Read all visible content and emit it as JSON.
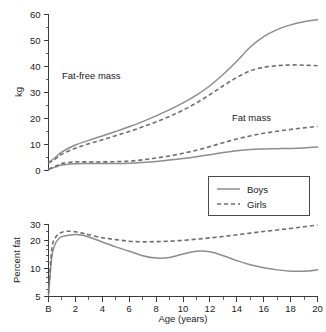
{
  "figure": {
    "background": "#ffffff",
    "line_color_boys": "#8d8d8d",
    "line_color_girls": "#6f6f6f",
    "axis_color": "#3a3a3a"
  },
  "legend": {
    "position": "center-middle",
    "items": [
      {
        "label": "Boys",
        "style": "solid"
      },
      {
        "label": "Girls",
        "style": "dashed"
      }
    ]
  },
  "xaxis": {
    "label": "Age (years)",
    "ticks": [
      "B",
      "2",
      "4",
      "6",
      "8",
      "10",
      "12",
      "14",
      "16",
      "18",
      "20"
    ],
    "values": [
      0,
      2,
      4,
      6,
      8,
      10,
      12,
      14,
      16,
      18,
      20
    ],
    "minor_step": 1,
    "range": [
      0,
      20
    ]
  },
  "chart_data": [
    {
      "type": "line",
      "id": "body-composition-kg",
      "title": "",
      "xlabel": "Age (years)",
      "ylabel": "kg",
      "xlim": [
        0,
        20
      ],
      "ylim": [
        0,
        60
      ],
      "ytick_labels": [
        "0",
        "10",
        "20",
        "30",
        "40",
        "50",
        "60"
      ],
      "ytick_values": [
        0,
        10,
        20,
        30,
        40,
        50,
        60
      ],
      "yminor_step": 5,
      "grid": false,
      "annotations": [
        {
          "text": "Fat-free mass",
          "x": 2.6,
          "y": 33
        },
        {
          "text": "Fat mass",
          "x": 13.6,
          "y": 21.5
        }
      ],
      "x": [
        0,
        0.5,
        1,
        2,
        3,
        4,
        5,
        6,
        7,
        8,
        9,
        10,
        11,
        12,
        13,
        14,
        15,
        16,
        17,
        18,
        19,
        20
      ],
      "series": [
        {
          "name": "Fat-free mass — Boys",
          "group": "Boys",
          "measure": "Fat-free mass",
          "style": "solid",
          "values": [
            3.1,
            5.0,
            7.2,
            9.8,
            11.6,
            13.3,
            15.0,
            16.8,
            18.8,
            21.0,
            23.4,
            26.0,
            29.0,
            32.6,
            37.0,
            42.0,
            47.5,
            51.5,
            54.2,
            56.0,
            57.2,
            58.0
          ]
        },
        {
          "name": "Fat-free mass — Girls",
          "group": "Girls",
          "measure": "Fat-free mass",
          "style": "dashed",
          "values": [
            2.9,
            4.4,
            6.3,
            8.6,
            10.3,
            11.8,
            13.4,
            15.0,
            16.8,
            18.7,
            20.8,
            23.2,
            26.0,
            29.2,
            32.6,
            35.8,
            38.3,
            39.7,
            40.3,
            40.6,
            40.5,
            40.3
          ]
        },
        {
          "name": "Fat mass — Boys",
          "group": "Boys",
          "measure": "Fat mass",
          "style": "solid",
          "values": [
            0.4,
            1.3,
            2.1,
            2.6,
            2.7,
            2.7,
            2.7,
            2.8,
            3.1,
            3.5,
            4.0,
            4.6,
            5.3,
            6.1,
            6.9,
            7.6,
            8.1,
            8.3,
            8.4,
            8.5,
            8.7,
            9.0
          ]
        },
        {
          "name": "Fat mass — Girls",
          "group": "Girls",
          "measure": "Fat mass",
          "style": "dashed",
          "values": [
            0.5,
            1.6,
            2.7,
            3.3,
            3.3,
            3.3,
            3.4,
            3.6,
            4.1,
            4.8,
            5.6,
            6.6,
            7.8,
            9.2,
            10.7,
            12.1,
            13.3,
            14.3,
            15.1,
            15.8,
            16.4,
            17.0
          ]
        }
      ]
    },
    {
      "type": "line",
      "id": "percent-fat",
      "title": "",
      "xlabel": "Age (years)",
      "ylabel": "Percent fat",
      "xlim": [
        0,
        20
      ],
      "ylim": [
        5,
        30
      ],
      "yscale": "log",
      "ytick_labels": [
        "5",
        "10",
        "20",
        "30"
      ],
      "ytick_values": [
        5,
        10,
        20,
        30
      ],
      "grid": false,
      "annotations": [],
      "x": [
        0,
        0.25,
        0.5,
        0.75,
        1,
        1.5,
        2,
        2.5,
        3,
        4,
        5,
        6,
        7,
        8,
        9,
        10,
        11,
        12,
        13,
        14,
        15,
        16,
        17,
        18,
        19,
        20
      ],
      "series": [
        {
          "name": "Percent fat — Boys",
          "group": "Boys",
          "measure": "Percent fat",
          "style": "solid",
          "values": [
            5.2,
            13.5,
            18.5,
            21.0,
            22.2,
            23.0,
            23.4,
            23.0,
            22.0,
            19.4,
            17.2,
            15.4,
            13.8,
            13.0,
            13.2,
            14.4,
            15.4,
            15.2,
            13.8,
            12.2,
            11.0,
            10.2,
            9.7,
            9.4,
            9.4,
            9.7
          ]
        },
        {
          "name": "Percent fat — Girls",
          "group": "Girls",
          "measure": "Percent fat",
          "style": "dashed",
          "values": [
            5.4,
            16.5,
            21.5,
            23.6,
            24.8,
            25.4,
            25.0,
            24.2,
            23.2,
            21.6,
            20.6,
            19.8,
            19.5,
            19.6,
            19.8,
            20.2,
            20.8,
            21.5,
            22.3,
            23.2,
            24.2,
            25.2,
            26.2,
            27.2,
            28.4,
            29.6
          ]
        }
      ]
    }
  ]
}
